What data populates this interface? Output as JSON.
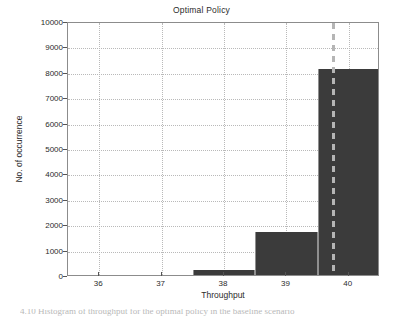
{
  "chart_data": {
    "type": "bar",
    "title": "Optimal Policy",
    "xlabel": "Throughput",
    "ylabel": "No. of occurrence",
    "categories": [
      36,
      37,
      38,
      39,
      40
    ],
    "values": [
      0,
      0,
      200,
      1700,
      8100
    ],
    "bar_width": 1,
    "xlim": [
      35.5,
      40.5
    ],
    "ylim": [
      0,
      10000
    ],
    "xticks": [
      "36",
      "37",
      "38",
      "39",
      "40"
    ],
    "yticks": [
      "0",
      "1000",
      "2000",
      "3000",
      "4000",
      "5000",
      "6000",
      "7000",
      "8000",
      "9000",
      "10000"
    ],
    "grid": true,
    "legend": "none",
    "bar_color": "#3b3b3b",
    "grid_color": "#b9b9b9",
    "axis_color": "#8c8c8c",
    "annotations": [
      {
        "name": "optimal-threshold-marker",
        "type": "vline",
        "x": 39.75,
        "style": "dashed",
        "color": "#b5b5b5"
      }
    ]
  },
  "caption": {
    "text": "4.10   Histogram of throughput for the optimal policy in the baseline scenario"
  }
}
